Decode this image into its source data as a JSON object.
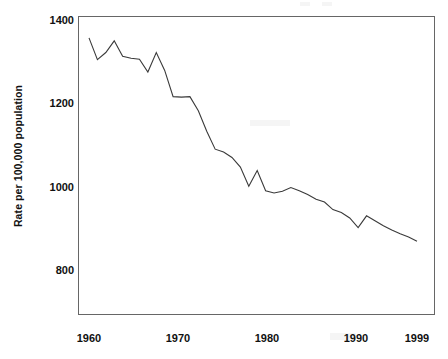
{
  "chart_data": {
    "type": "line",
    "title": "",
    "xlabel": "",
    "ylabel": "Rate per 100,000 population",
    "xlim": [
      1960,
      1999
    ],
    "ylim": [
      700,
      1400
    ],
    "grid": false,
    "legend": null,
    "x_tick_labels": [
      "1960",
      "1970",
      "1980",
      "1990",
      "1999"
    ],
    "x_ticks": [
      1960,
      1970,
      1980,
      1990,
      1999
    ],
    "y_tick_labels": [
      "1400",
      "1200",
      "1000",
      "800"
    ],
    "y_ticks": [
      1400,
      1200,
      1000,
      800
    ],
    "series": [
      {
        "name": "Rate per 100,000 population",
        "color": "#3a3a3a",
        "x": [
          1960,
          1961,
          1962,
          1963,
          1964,
          1965,
          1966,
          1967,
          1968,
          1969,
          1970,
          1971,
          1972,
          1973,
          1974,
          1975,
          1976,
          1977,
          1978,
          1979,
          1980,
          1981,
          1982,
          1983,
          1984,
          1985,
          1986,
          1987,
          1988,
          1989,
          1990,
          1991,
          1992,
          1993,
          1994,
          1995,
          1996,
          1997,
          1998,
          1999
        ],
        "values": [
          1357,
          1305,
          1322,
          1350,
          1313,
          1308,
          1306,
          1275,
          1322,
          1279,
          1216,
          1215,
          1216,
          1182,
          1133,
          1090,
          1083,
          1070,
          1047,
          1001,
          1039,
          990,
          985,
          989,
          998,
          990,
          981,
          970,
          963,
          945,
          938,
          925,
          902,
          930,
          918,
          906,
          896,
          887,
          879,
          869
        ]
      }
    ]
  },
  "axes": {
    "y_title": "Rate per 100,000 population"
  }
}
